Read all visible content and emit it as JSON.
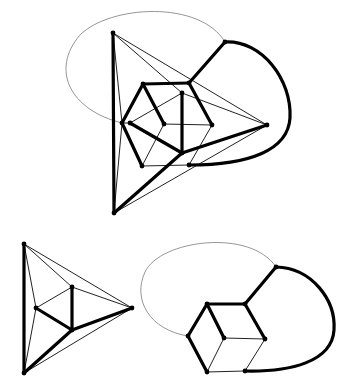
{
  "figure": {
    "colors": {
      "thick_edge": "#000000",
      "thin_edge": "#222222",
      "grey_curve": "#8a8a8a",
      "node": "#000000"
    }
  },
  "graphs": [
    {
      "id": "top",
      "nodes": {
        "TL": [
          113,
          33
        ],
        "BL": [
          114,
          213
        ],
        "R": [
          267,
          125
        ],
        "A": [
          225,
          42
        ],
        "HTL": [
          143,
          84
        ],
        "HTR": [
          189,
          83
        ],
        "HL": [
          122,
          123
        ],
        "IL": [
          130,
          123
        ],
        "C": [
          164,
          124
        ],
        "HR": [
          212,
          125
        ],
        "IT": [
          182,
          93
        ],
        "IB": [
          182,
          153
        ],
        "HBL": [
          142,
          166
        ],
        "BR": [
          189,
          165
        ]
      },
      "thick_edges": [
        [
          "TL",
          "BL"
        ],
        [
          "BL",
          "IB"
        ],
        [
          "IB",
          "R"
        ],
        [
          "HTL",
          "HTR"
        ],
        [
          "HTL",
          "HL"
        ],
        [
          "HTL",
          "C"
        ],
        [
          "HTR",
          "HR"
        ],
        [
          "HTR",
          "A"
        ],
        [
          "HL",
          "HBL"
        ],
        [
          "IL",
          "IB"
        ],
        [
          "IT",
          "IB"
        ]
      ],
      "thin_edges": [
        [
          "TL",
          "R"
        ],
        [
          "TL",
          "IT"
        ],
        [
          "TL",
          "HL"
        ],
        [
          "BL",
          "R"
        ],
        [
          "BL",
          "HL"
        ],
        [
          "HL",
          "IL"
        ],
        [
          "IL",
          "IT"
        ],
        [
          "IT",
          "R"
        ],
        [
          "C",
          "HR"
        ],
        [
          "C",
          "HBL"
        ],
        [
          "HR",
          "BR"
        ],
        [
          "HBL",
          "BR"
        ]
      ],
      "thick_curves": [
        {
          "from": "A",
          "to": "BR",
          "path": "M225,42 C262,40 292,80 290,118 C288,150 250,165 189,165"
        }
      ],
      "grey_curves": [
        {
          "from": "HL",
          "to": "A",
          "path": "M122,123 C70,110 50,70 80,35 C110,5 200,0 225,42"
        }
      ]
    },
    {
      "id": "bottom-left",
      "nodes": {
        "T": [
          24,
          244
        ],
        "B": [
          24,
          373
        ],
        "R": [
          132,
          308
        ],
        "IT": [
          72,
          287
        ],
        "IL": [
          36,
          308
        ],
        "IB": [
          72,
          330
        ]
      },
      "thick_edges": [
        [
          "T",
          "B"
        ],
        [
          "B",
          "IB"
        ],
        [
          "IB",
          "R"
        ],
        [
          "IL",
          "IB"
        ],
        [
          "IT",
          "IB"
        ]
      ],
      "thin_edges": [
        [
          "T",
          "R"
        ],
        [
          "T",
          "IT"
        ],
        [
          "T",
          "IL"
        ],
        [
          "B",
          "IL"
        ],
        [
          "B",
          "R"
        ],
        [
          "IL",
          "IT"
        ],
        [
          "IT",
          "R"
        ]
      ],
      "thick_curves": [],
      "grey_curves": []
    },
    {
      "id": "bottom-right",
      "nodes": {
        "TL": [
          207,
          304
        ],
        "TR": [
          245,
          304
        ],
        "L": [
          188,
          336
        ],
        "C": [
          224,
          338
        ],
        "R": [
          265,
          339
        ],
        "BL": [
          207,
          372
        ],
        "BR": [
          245,
          371
        ],
        "A": [
          276,
          267
        ]
      },
      "thick_edges": [
        [
          "TL",
          "TR"
        ],
        [
          "TL",
          "L"
        ],
        [
          "TL",
          "C"
        ],
        [
          "TR",
          "R"
        ],
        [
          "TR",
          "A"
        ],
        [
          "L",
          "BL"
        ]
      ],
      "thin_edges": [
        [
          "C",
          "R"
        ],
        [
          "C",
          "BL"
        ],
        [
          "R",
          "BR"
        ],
        [
          "BL",
          "BR"
        ]
      ],
      "thick_curves": [
        {
          "from": "A",
          "to": "BR",
          "path": "M276,267 C312,268 336,300 334,330 C332,362 290,372 245,371"
        }
      ],
      "grey_curves": [
        {
          "from": "L",
          "to": "A",
          "path": "M188,336 C150,330 132,300 145,272 C160,240 250,228 276,267"
        }
      ]
    }
  ]
}
